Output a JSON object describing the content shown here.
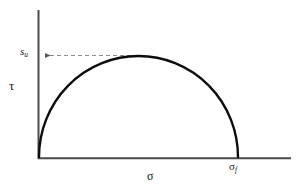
{
  "figure": {
    "name": "mohr-circle-failure-envelope",
    "background_color": "#ffffff",
    "width": 298,
    "height": 194
  },
  "axes": {
    "y_axis": {
      "label": "τ",
      "icon": "vertical-axis-line",
      "color": "#4a4a4a",
      "x": 38,
      "y_top": 10,
      "y_bottom": 159,
      "width": 2
    },
    "x_axis": {
      "label": "σ",
      "icon": "horizontal-axis-line",
      "color": "#4a4a4a",
      "y": 158,
      "x_left": 38,
      "x_right": 291,
      "width": 2
    }
  },
  "annotations": {
    "peak_label": {
      "symbol": "s",
      "subscript": "u",
      "text": "su",
      "description": "undrained shear strength at circle apex"
    },
    "failure_stress_label": {
      "symbol": "σ",
      "subscript": "f",
      "text": "σf",
      "description": "failure normal stress where circle meets sigma axis"
    },
    "leader_line": {
      "icon": "dashed-arrow-left",
      "color": "#8c8c8c",
      "style": "dashed",
      "arrowhead": "left",
      "y": 55,
      "x_start": 138,
      "x_end": 41
    }
  },
  "chart_data": {
    "type": "line",
    "title": "",
    "xlabel": "σ",
    "ylabel": "τ",
    "grid": false,
    "legend": null,
    "curve_name": "mohr-circle-arc",
    "curve_color": "#0d0d0d",
    "curve_width": 2.4,
    "geometry": {
      "shape": "semicircle",
      "origin_px": [
        38,
        158
      ],
      "start_px": [
        39,
        157
      ],
      "end_px": [
        238,
        157
      ],
      "apex_px": [
        138,
        56
      ],
      "center_px": [
        138,
        157
      ],
      "radius_px": 100
    },
    "x": [
      0,
      5,
      10,
      15,
      20,
      25,
      30,
      35,
      40,
      45,
      50,
      55,
      60,
      65,
      70,
      75,
      80,
      85,
      90,
      95,
      100,
      105,
      110,
      115,
      120,
      125,
      130,
      135,
      140,
      145,
      150,
      155,
      160,
      165,
      170,
      175,
      180,
      185,
      190,
      195,
      200
    ],
    "values": [
      0,
      31.2,
      43.6,
      52.7,
      60.0,
      66.1,
      71.4,
      76.0,
      80.0,
      83.5,
      86.6,
      89.3,
      91.7,
      93.7,
      95.4,
      96.8,
      98.0,
      98.9,
      99.5,
      99.9,
      100.0,
      99.9,
      99.5,
      98.9,
      98.0,
      96.8,
      95.4,
      93.7,
      91.7,
      89.3,
      86.6,
      83.5,
      80.0,
      76.0,
      71.4,
      66.1,
      60.0,
      52.7,
      43.6,
      31.2,
      0
    ],
    "xlim": [
      0,
      253
    ],
    "ylim": [
      0,
      148
    ],
    "markers": {
      "sigma_f_x": 200,
      "su_y": 100
    }
  }
}
